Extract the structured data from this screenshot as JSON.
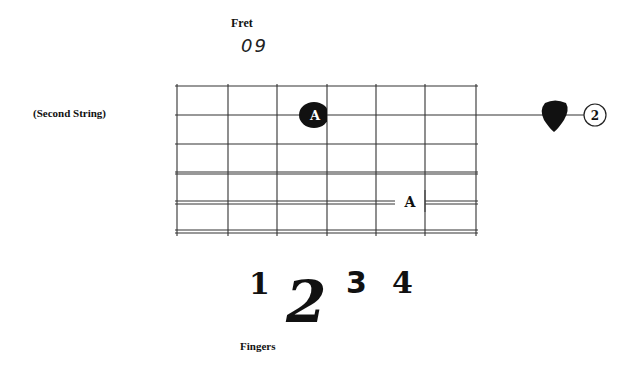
{
  "fret": {
    "label": "Fret",
    "number": "09"
  },
  "string": {
    "label": "(Second String)",
    "number": "2"
  },
  "notes": {
    "fretted": "A",
    "target": "A"
  },
  "fingers": {
    "label": "Fingers",
    "numbers": [
      "1",
      "2",
      "3",
      "4"
    ],
    "highlighted": "2"
  },
  "icons": {
    "pick": "guitar-pick-icon",
    "string_marker": "circled-number-icon"
  },
  "colors": {
    "ink": "#111111",
    "grid": "#444444",
    "background": "#ffffff"
  }
}
